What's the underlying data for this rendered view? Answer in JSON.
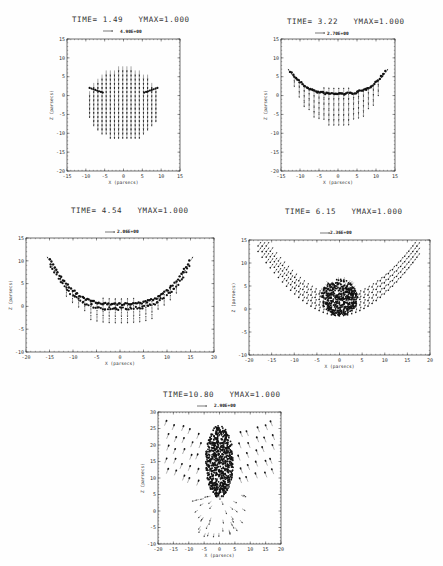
{
  "chart_data": [
    {
      "type": "quiver",
      "title": "TIME= 1.49   YMAX=1.000",
      "time": 1.49,
      "ymax": 1.0,
      "reference_arrow_label": "4.90E+00",
      "xlabel": "X (parsecs)",
      "ylabel": "Z (parsecs)",
      "xlim": [
        -15,
        15
      ],
      "ylim": [
        -20,
        15
      ],
      "xticks": [
        -15,
        -10,
        -5,
        0,
        5,
        10,
        15
      ],
      "yticks": [
        -20,
        -15,
        -10,
        -5,
        0,
        5,
        10,
        15
      ],
      "description": "Circular cloud of grid points (radius ~9.5, centered z~-2.5) with downward-pointing arrows; dense compressed layer along a shallow arc near z~1-2 at |x|~6-9",
      "shape": "disk",
      "cx": 0,
      "cz": -2.5,
      "r": 9.5,
      "flow": "down"
    },
    {
      "type": "quiver",
      "title": "TIME= 3.22   YMAX=1.000",
      "time": 3.22,
      "ymax": 1.0,
      "reference_arrow_label": "2.70E+00",
      "xlabel": "X (parsecs)",
      "ylabel": "Z (parsecs)",
      "xlim": [
        -15,
        15
      ],
      "ylim": [
        -20,
        15
      ],
      "xticks": [
        -15,
        -10,
        -5,
        0,
        5,
        10,
        15
      ],
      "yticks": [
        -20,
        -15,
        -10,
        -5,
        0,
        5,
        10,
        15
      ],
      "description": "Bowl-shaped dense shell from x=-12 to 12, bottom at z~0, rising to z~6 at edges; arrows below shell point downward to z~-9",
      "shape": "bowl",
      "x_half": 12.5,
      "z_bottom": 0.5,
      "z_edge": 6.5,
      "depth": 8.5,
      "flow": "down"
    },
    {
      "type": "quiver",
      "title": "TIME= 4.54   YMAX=1.000",
      "time": 4.54,
      "ymax": 1.0,
      "reference_arrow_label": "2.06E+00",
      "xlabel": "X (parsecs)",
      "ylabel": "Z (parsecs)",
      "xlim": [
        -20,
        20
      ],
      "ylim": [
        -10,
        15
      ],
      "xticks": [
        -20,
        -15,
        -10,
        -5,
        0,
        5,
        10,
        15,
        20
      ],
      "yticks": [
        -10,
        -5,
        0,
        5,
        10,
        15
      ],
      "description": "Wider U-shaped dense shell from x=-15 to 15, bottom at z~0, edges z~10; arrows below pointing down to z~-5",
      "shape": "bowl",
      "x_half": 15,
      "z_bottom": 0.5,
      "z_edge": 10.5,
      "depth": 4.5,
      "flow": "down"
    },
    {
      "type": "quiver",
      "title": "TIME= 6.15   YMAX=1.000",
      "time": 6.15,
      "ymax": 1.0,
      "reference_arrow_label": "2.36E+00",
      "xlabel": "X (parsecs)",
      "ylabel": "Z (parsecs)",
      "xlim": [
        -20,
        20
      ],
      "ylim": [
        -10,
        15
      ],
      "xticks": [
        -20,
        -15,
        -10,
        -5,
        0,
        5,
        10,
        15,
        20
      ],
      "yticks": [
        -10,
        -5,
        0,
        5,
        10,
        15
      ],
      "description": "V/U-shaped shell from x=-18 to 18 reaching z~14 at edges; dense central clump at x~0, z~-1 to 6; arrows point outward-upward",
      "shape": "vshell",
      "x_half": 18,
      "z_bottom": 0,
      "z_edge": 14,
      "clump": {
        "cx": 0,
        "cz": 2.5,
        "rx": 4,
        "rz": 4
      },
      "flow": "out"
    },
    {
      "type": "quiver",
      "title": "TIME=10.80   YMAX=1.000",
      "time": 10.8,
      "ymax": 1.0,
      "reference_arrow_label": "2.90E+00",
      "xlabel": "X (parsecs)",
      "ylabel": "Z (parsecs)",
      "xlim": [
        -20,
        20
      ],
      "ylim": [
        -10,
        30
      ],
      "xticks": [
        -20,
        -15,
        -10,
        -5,
        0,
        5,
        10,
        15,
        20
      ],
      "yticks": [
        -10,
        -5,
        0,
        5,
        10,
        15,
        20,
        25,
        30
      ],
      "description": "Dense elongated column at x~0 from z~5 to 26; fan of outward/upward arrows on wings from x=-18 to 18, z=8-26; sparse radial arrows below column pointing down to z~-8",
      "shape": "column",
      "clump": {
        "cx": 0,
        "cz": 15,
        "rx": 4.5,
        "rz": 11
      },
      "flow": "up"
    }
  ]
}
